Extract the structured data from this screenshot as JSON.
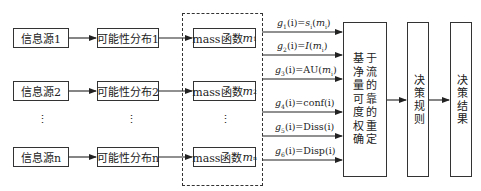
{
  "diagram": {
    "sources": [
      {
        "label": "信息源1"
      },
      {
        "label": "信息源2"
      },
      {
        "label": "信息源n"
      }
    ],
    "distributions": [
      {
        "label": "可能性分布1"
      },
      {
        "label": "可能性分布2"
      },
      {
        "label": "可能性分布n"
      }
    ],
    "mass_functions": [
      {
        "prefix": "mass函数",
        "var": "m",
        "sub": "1"
      },
      {
        "prefix": "mass函数",
        "var": "m",
        "sub": "2"
      },
      {
        "prefix": "mass函数",
        "var": "m",
        "sub": "n"
      }
    ],
    "ellipsis": "⋮",
    "edge_labels": [
      {
        "g": "g",
        "gsub": "1",
        "arg": "(i)=",
        "fn": "s",
        "fnsub": "i",
        "open": "(",
        "m": "m",
        "msub": "i",
        "close": ")"
      },
      {
        "g": "g",
        "gsub": "2",
        "arg": "(i)=",
        "fn": "I",
        "fnsub": "",
        "open": "(",
        "m": "m",
        "msub": "i",
        "close": ")"
      },
      {
        "g": "g",
        "gsub": "3",
        "arg": "(i)=",
        "fn": "AU",
        "fnsub": "",
        "open": "(",
        "m": "m",
        "msub": "i",
        "close": ")"
      },
      {
        "g": "g",
        "gsub": "4",
        "arg": "(i)=",
        "fn": "conf(i)",
        "fnsub": "",
        "open": "",
        "m": "",
        "msub": "",
        "close": ""
      },
      {
        "g": "g",
        "gsub": "5",
        "arg": "(i)=",
        "fn": "Diss(i)",
        "fnsub": "",
        "open": "",
        "m": "",
        "msub": "",
        "close": ""
      },
      {
        "g": "g",
        "gsub": "6",
        "arg": "(i)=",
        "fn": "Disp(i)",
        "fnsub": "",
        "open": "",
        "m": "",
        "msub": "",
        "close": ""
      }
    ],
    "center_box": {
      "chars": [
        "基",
        "于",
        "净",
        "流",
        "量",
        "的",
        "可",
        "靠",
        "度",
        "的",
        "权",
        "重",
        "确",
        "定"
      ],
      "text": "基于净流量的可靠度的权重确定"
    },
    "decision_rule": {
      "label": "决策规则"
    },
    "decision_result": {
      "label": "决策结果"
    }
  }
}
